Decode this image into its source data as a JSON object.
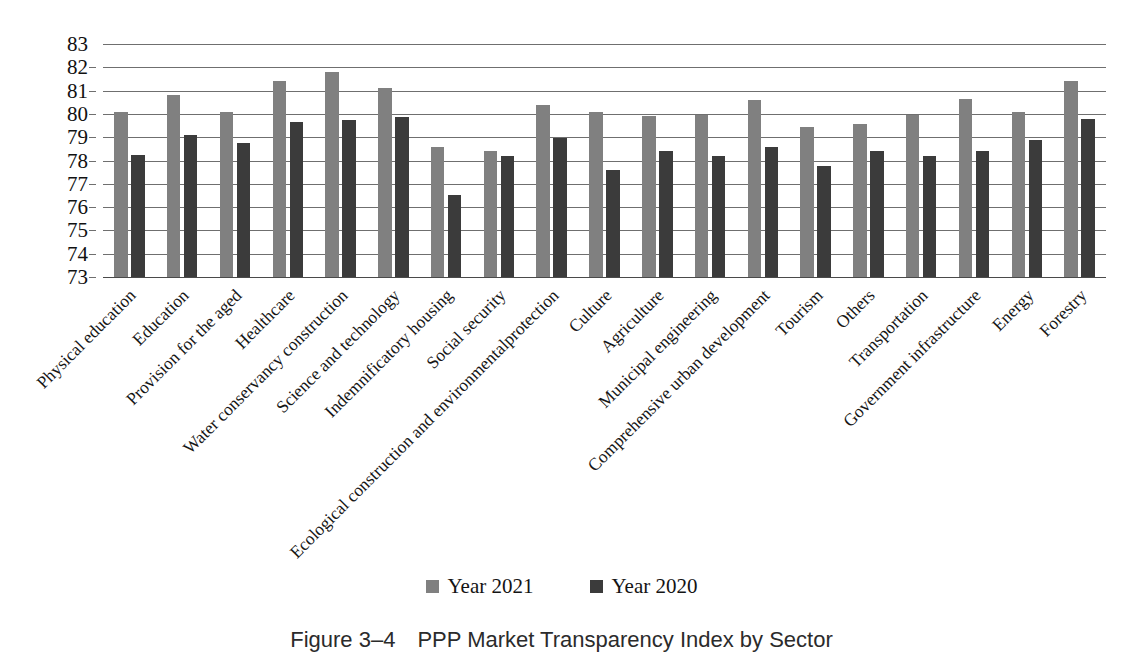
{
  "chart_data": {
    "type": "bar",
    "title": "",
    "xlabel": "",
    "ylabel": "",
    "ylim": [
      73,
      83
    ],
    "ytick_step": 1,
    "yticks": [
      83,
      82,
      81,
      80,
      79,
      78,
      77,
      76,
      75,
      74,
      73
    ],
    "grid": true,
    "legend_position": "bottom-center",
    "categories": [
      "Physical education",
      "Education",
      "Provision for the aged",
      "Healthcare",
      "Water conservancy construction",
      "Science and technology",
      "Indemnificatory housing",
      "Social security",
      "Ecological construction and environmentalprotection",
      "Culture",
      "Agriculture",
      "Municipal engineering",
      "Comprehensive urban development",
      "Tourism",
      "Others",
      "Transportation",
      "Government infrastructure",
      "Energy",
      "Forestry"
    ],
    "series": [
      {
        "name": "Year 2021",
        "color": "#808080",
        "values": [
          80.1,
          80.8,
          80.1,
          81.4,
          81.8,
          81.1,
          78.6,
          78.4,
          80.4,
          80.1,
          79.9,
          79.95,
          80.6,
          79.45,
          79.55,
          79.95,
          80.65,
          80.1,
          81.4
        ]
      },
      {
        "name": "Year 2020",
        "color": "#3b3b3b",
        "values": [
          78.25,
          79.1,
          78.75,
          79.65,
          79.75,
          79.85,
          76.5,
          78.2,
          78.95,
          77.6,
          78.4,
          78.2,
          78.6,
          77.75,
          78.4,
          78.2,
          78.4,
          78.9,
          79.8
        ]
      }
    ]
  },
  "legend": {
    "items": [
      {
        "label": "Year 2021",
        "color": "#808080"
      },
      {
        "label": "Year 2020",
        "color": "#3b3b3b"
      }
    ]
  },
  "caption": {
    "number": "Figure 3–4",
    "text": "PPP Market Transparency Index by Sector"
  }
}
